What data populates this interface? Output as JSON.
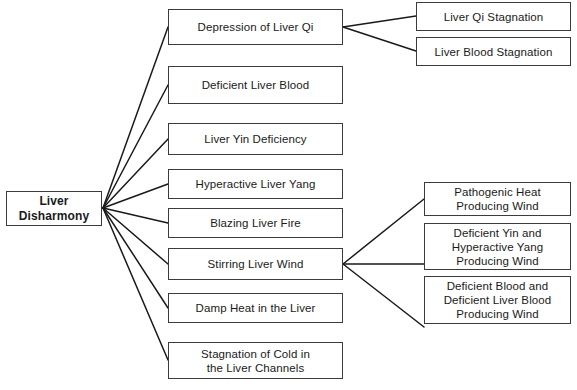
{
  "diagram": {
    "type": "hierarchy-tree",
    "orientation": "left-to-right",
    "colors": {
      "background": "#ffffff",
      "box_border": "#3b3b3b",
      "box_fill": "#ffffff",
      "text": "#1a1a1a",
      "connector": "#1a1a1a"
    },
    "root": {
      "id": "root",
      "label": "Liver\nDisharmony"
    },
    "level1": [
      {
        "id": "l1-0",
        "label": "Depression of Liver Qi"
      },
      {
        "id": "l1-1",
        "label": "Deficient Liver Blood"
      },
      {
        "id": "l1-2",
        "label": "Liver Yin Deficiency"
      },
      {
        "id": "l1-3",
        "label": "Hyperactive Liver Yang"
      },
      {
        "id": "l1-4",
        "label": "Blazing Liver Fire"
      },
      {
        "id": "l1-5",
        "label": "Stirring Liver Wind"
      },
      {
        "id": "l1-6",
        "label": "Damp Heat in the Liver"
      },
      {
        "id": "l1-7",
        "label": "Stagnation of Cold in\nthe Liver Channels"
      }
    ],
    "level2_qi": [
      {
        "id": "l2-0",
        "label": "Liver Qi Stagnation",
        "parent": "l1-0"
      },
      {
        "id": "l2-1",
        "label": "Liver Blood Stagnation",
        "parent": "l1-0"
      }
    ],
    "level2_wind": [
      {
        "id": "l2-2",
        "label": "Pathogenic Heat\nProducing Wind",
        "parent": "l1-5"
      },
      {
        "id": "l2-3",
        "label": "Deficient Yin and\nHyperactive Yang\nProducing Wind",
        "parent": "l1-5"
      },
      {
        "id": "l2-4",
        "label": "Deficient Blood and\nDeficient Liver Blood\nProducing Wind",
        "parent": "l1-5"
      }
    ]
  }
}
